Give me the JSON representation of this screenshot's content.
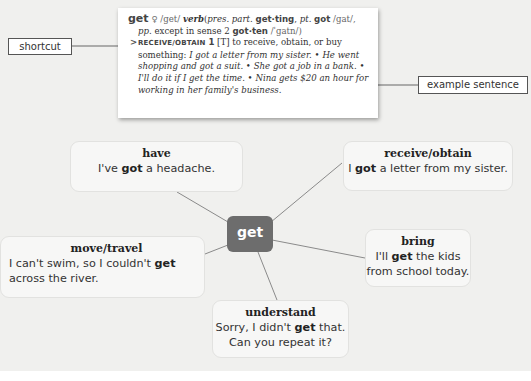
{
  "colors": {
    "panel_bg": "#f0f0ee",
    "center_node": "#6d6d6d",
    "node_bg": "#f7f7f6",
    "connector": "#8a8a8a"
  },
  "dictionary_entry": {
    "headword": "get",
    "key_icon": "key-icon",
    "pronunciation": "/get/",
    "part_of_speech": "verb",
    "forms_open": "(",
    "pres_part_label": "pres. part.",
    "pres_part": "get·ting",
    "past_label": "pt.",
    "past": "got",
    "past_ipa": "/gat/,",
    "pp_label": "pp.",
    "pp_note": "except in sense 2",
    "pp": "got·ten",
    "pp_ipa": "/ˈgatn/)",
    "sense_arrow": ">",
    "shortcut": "RECEIVE/OBTAIN",
    "sense_number": "1",
    "grammar": "[T]",
    "definition": "to receive, obtain, or buy something:",
    "examples": [
      "I got a letter from my sister.",
      "He went shopping and got a suit.",
      "She got a job in a bank.",
      "I'll do it if I get the time.",
      "Nina gets $20 an hour for working in her family's business."
    ],
    "bullet": "•"
  },
  "callouts": {
    "shortcut": "shortcut",
    "example_sentence": "example sentence"
  },
  "mindmap": {
    "center": "get",
    "nodes": [
      {
        "title": "have",
        "pre": "I've ",
        "bold": "got",
        "post": " a headache."
      },
      {
        "title": "receive/obtain",
        "pre": "I ",
        "bold": "got",
        "post": " a letter from my sister."
      },
      {
        "title": "move/travel",
        "pre": "I can't swim, so I couldn't ",
        "bold": "get",
        "post": " across the river."
      },
      {
        "title": "bring",
        "pre": "I'll ",
        "bold": "get",
        "post": " the kids from school today."
      },
      {
        "title": "understand",
        "pre": "Sorry, I didn't ",
        "bold": "get",
        "post": " that. Can you repeat it?"
      }
    ]
  }
}
